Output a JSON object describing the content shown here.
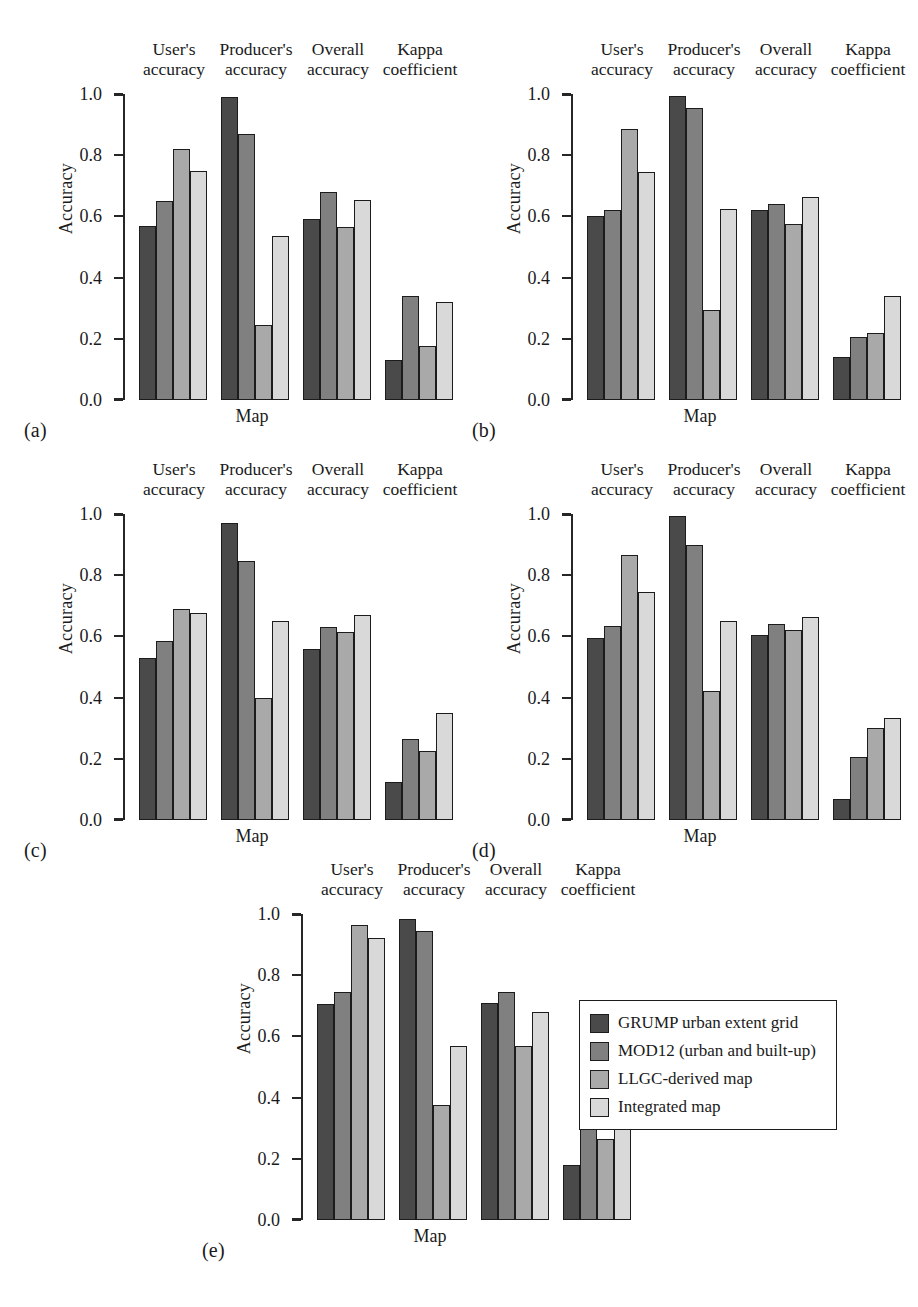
{
  "figure": {
    "panels": [
      "(a)",
      "(b)",
      "(c)",
      "(d)",
      "(e)"
    ],
    "xlabel": "Map",
    "ylabel": "Accuracy",
    "tick_labels": [
      "1.0",
      "0.8",
      "0.6",
      "0.4",
      "0.2",
      "0.0"
    ],
    "group_headers": [
      {
        "line1": "User's",
        "line2": "accuracy"
      },
      {
        "line1": "Producer's",
        "line2": "accuracy"
      },
      {
        "line1": "Overall",
        "line2": "accuracy"
      },
      {
        "line1": "Kappa",
        "line2": "coefficient"
      }
    ]
  },
  "legend": {
    "position": "bottom-right",
    "items": [
      {
        "label": "GRUMP urban extent grid",
        "color": "#4a4a4a",
        "swatch": "series-0-swatch"
      },
      {
        "label": "MOD12 (urban and built-up)",
        "color": "#808080",
        "swatch": "series-1-swatch"
      },
      {
        "label": "LLGC-derived map",
        "color": "#a9a9a9",
        "swatch": "series-2-swatch"
      },
      {
        "label": "Integrated map",
        "color": "#d9d9d9",
        "swatch": "series-3-swatch"
      }
    ]
  },
  "chart_data": [
    {
      "type": "bar",
      "panel": "(a)",
      "title": "",
      "xlabel": "Map",
      "ylabel": "Accuracy",
      "ylim": [
        0.0,
        1.0
      ],
      "yticks": [
        0.0,
        0.2,
        0.4,
        0.6,
        0.8,
        1.0
      ],
      "grid": false,
      "categories": [
        "User's accuracy",
        "Producer's accuracy",
        "Overall accuracy",
        "Kappa coefficient"
      ],
      "series": [
        {
          "name": "GRUMP urban extent grid",
          "values": [
            0.57,
            0.99,
            0.59,
            0.13
          ]
        },
        {
          "name": "MOD12 (urban and built-up)",
          "values": [
            0.65,
            0.87,
            0.68,
            0.34
          ]
        },
        {
          "name": "LLGC-derived map",
          "values": [
            0.82,
            0.245,
            0.565,
            0.175
          ]
        },
        {
          "name": "Integrated map",
          "values": [
            0.75,
            0.535,
            0.655,
            0.32
          ]
        }
      ]
    },
    {
      "type": "bar",
      "panel": "(b)",
      "title": "",
      "xlabel": "Map",
      "ylabel": "Accuracy",
      "ylim": [
        0.0,
        1.0
      ],
      "yticks": [
        0.0,
        0.2,
        0.4,
        0.6,
        0.8,
        1.0
      ],
      "grid": false,
      "categories": [
        "User's accuracy",
        "Producer's accuracy",
        "Overall accuracy",
        "Kappa coefficient"
      ],
      "series": [
        {
          "name": "GRUMP urban extent grid",
          "values": [
            0.6,
            0.995,
            0.62,
            0.14
          ]
        },
        {
          "name": "MOD12 (urban and built-up)",
          "values": [
            0.62,
            0.955,
            0.64,
            0.205
          ]
        },
        {
          "name": "LLGC-derived map",
          "values": [
            0.885,
            0.295,
            0.575,
            0.22
          ]
        },
        {
          "name": "Integrated map",
          "values": [
            0.745,
            0.625,
            0.665,
            0.34
          ]
        }
      ]
    },
    {
      "type": "bar",
      "panel": "(c)",
      "title": "",
      "xlabel": "Map",
      "ylabel": "Accuracy",
      "ylim": [
        0.0,
        1.0
      ],
      "yticks": [
        0.0,
        0.2,
        0.4,
        0.6,
        0.8,
        1.0
      ],
      "grid": false,
      "categories": [
        "User's accuracy",
        "Producer's accuracy",
        "Overall accuracy",
        "Kappa coefficient"
      ],
      "series": [
        {
          "name": "GRUMP urban extent grid",
          "values": [
            0.53,
            0.97,
            0.56,
            0.125
          ]
        },
        {
          "name": "MOD12 (urban and built-up)",
          "values": [
            0.585,
            0.845,
            0.63,
            0.265
          ]
        },
        {
          "name": "LLGC-derived map",
          "values": [
            0.69,
            0.4,
            0.615,
            0.225
          ]
        },
        {
          "name": "Integrated map",
          "values": [
            0.675,
            0.65,
            0.67,
            0.35
          ]
        }
      ]
    },
    {
      "type": "bar",
      "panel": "(d)",
      "title": "",
      "xlabel": "Map",
      "ylabel": "Accuracy",
      "ylim": [
        0.0,
        1.0
      ],
      "yticks": [
        0.0,
        0.2,
        0.4,
        0.6,
        0.8,
        1.0
      ],
      "grid": false,
      "categories": [
        "User's accuracy",
        "Producer's accuracy",
        "Overall accuracy",
        "Kappa coefficient"
      ],
      "series": [
        {
          "name": "GRUMP urban extent grid",
          "values": [
            0.595,
            0.995,
            0.605,
            0.07
          ]
        },
        {
          "name": "MOD12 (urban and built-up)",
          "values": [
            0.635,
            0.9,
            0.64,
            0.205
          ]
        },
        {
          "name": "LLGC-derived map",
          "values": [
            0.865,
            0.42,
            0.62,
            0.3
          ]
        },
        {
          "name": "Integrated map",
          "values": [
            0.745,
            0.65,
            0.665,
            0.335
          ]
        }
      ]
    },
    {
      "type": "bar",
      "panel": "(e)",
      "title": "",
      "xlabel": "Map",
      "ylabel": "Accuracy",
      "ylim": [
        0.0,
        1.0
      ],
      "yticks": [
        0.0,
        0.2,
        0.4,
        0.6,
        0.8,
        1.0
      ],
      "grid": false,
      "categories": [
        "User's accuracy",
        "Producer's accuracy",
        "Overall accuracy",
        "Kappa coefficient"
      ],
      "series": [
        {
          "name": "GRUMP urban extent grid",
          "values": [
            0.705,
            0.985,
            0.71,
            0.18
          ]
        },
        {
          "name": "MOD12 (urban and built-up)",
          "values": [
            0.745,
            0.945,
            0.745,
            0.325
          ]
        },
        {
          "name": "LLGC-derived map",
          "values": [
            0.965,
            0.375,
            0.57,
            0.265
          ]
        },
        {
          "name": "Integrated map",
          "values": [
            0.92,
            0.57,
            0.68,
            0.4
          ]
        }
      ]
    }
  ]
}
